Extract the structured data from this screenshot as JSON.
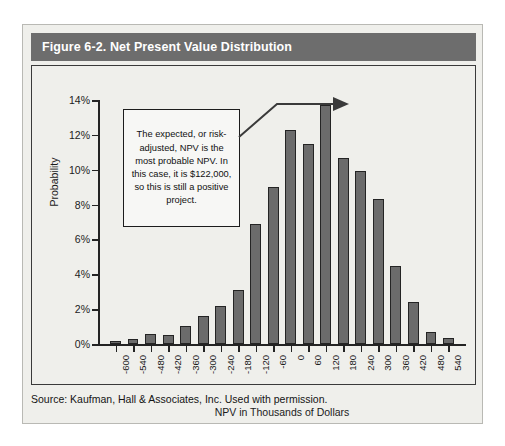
{
  "figure": {
    "title": "Figure 6-2. Net Present Value Distribution",
    "source_note": "Source: Kaufman, Hall & Associates, Inc. Used with permission.",
    "callout": "The expected, or risk-adjusted, NPV is the most probable NPV. In this case, it is $122,000, so this is still a positive project."
  },
  "colors": {
    "title_bar": "#6d6d6d",
    "title_text": "#ffffff",
    "plot_background": "#efefeb",
    "bar_fill": "#6b6b6b",
    "bar_border": "#242424",
    "axis": "#232323"
  },
  "chart_data": {
    "type": "bar",
    "title": "Figure 6-2. Net Present Value Distribution",
    "xlabel": "NPV in Thousands of Dollars",
    "ylabel": "Probability",
    "categories": [
      "-600",
      "-540",
      "-480",
      "-420",
      "-360",
      "-300",
      "-240",
      "-180",
      "-120",
      "-60",
      "0",
      "60",
      "120",
      "180",
      "240",
      "300",
      "360",
      "420",
      "480",
      "540"
    ],
    "values": [
      0.15,
      0.3,
      0.6,
      0.5,
      1.05,
      1.6,
      2.2,
      3.1,
      6.9,
      9.0,
      12.3,
      11.5,
      13.7,
      10.7,
      9.9,
      8.3,
      4.5,
      2.4,
      0.7,
      0.35
    ],
    "value_unit": "%",
    "ylim": [
      0,
      14
    ],
    "y_ticks": [
      "0%",
      "2%",
      "4%",
      "6%",
      "8%",
      "10%",
      "12%",
      "14%"
    ],
    "y_tick_values": [
      0,
      2,
      4,
      6,
      8,
      10,
      12,
      14
    ],
    "grid": false,
    "legend": "none",
    "annotations": [
      {
        "text": "The expected, or risk-adjusted, NPV is the most probable NPV. In this case, it is $122,000, so this is still a positive project.",
        "points_to_category": "120"
      }
    ]
  }
}
